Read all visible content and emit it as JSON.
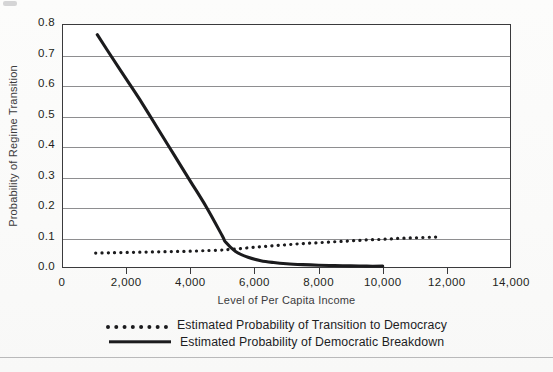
{
  "chart_data": {
    "type": "line",
    "title": "",
    "xlabel": "Level of Per Capita Income",
    "ylabel": "Probability of Regime Transition",
    "xlim": [
      0,
      14000
    ],
    "ylim": [
      0.0,
      0.8
    ],
    "grid": true,
    "legend_position": "bottom-center",
    "xticks": [
      0,
      2000,
      4000,
      6000,
      8000,
      10000,
      12000,
      14000
    ],
    "xticklabels": [
      "0",
      "2,000",
      "4,000",
      "6,000",
      "8,000",
      "10,000",
      "12,000",
      "14,000"
    ],
    "yticks": [
      0.0,
      0.1,
      0.2,
      0.3,
      0.4,
      0.5,
      0.6,
      0.7,
      0.8
    ],
    "yticklabels": [
      "0.0",
      "0.1",
      "0.2",
      "0.3",
      "0.4",
      "0.5",
      "0.6",
      "0.7",
      "0.8"
    ],
    "series": [
      {
        "name": "Estimated Probability of Transition to Democracy",
        "style": "dotted",
        "color": "#1b1b1d",
        "x": [
          1050,
          1500,
          2000,
          2500,
          3000,
          3500,
          4000,
          4500,
          5000,
          5100,
          5500,
          6000,
          6500,
          7000,
          7500,
          8000,
          8500,
          9000,
          9500,
          10000,
          10500,
          11000,
          11500,
          11800
        ],
        "y": [
          0.049,
          0.05,
          0.051,
          0.052,
          0.053,
          0.054,
          0.055,
          0.057,
          0.059,
          0.06,
          0.063,
          0.068,
          0.072,
          0.076,
          0.08,
          0.083,
          0.086,
          0.089,
          0.092,
          0.094,
          0.097,
          0.099,
          0.101,
          0.102
        ]
      },
      {
        "name": "Estimated Probability of Democratic Breakdown",
        "style": "solid",
        "color": "#1b1b1d",
        "x": [
          1100,
          1500,
          2000,
          2500,
          3000,
          3500,
          4000,
          4500,
          5000,
          5100,
          5400,
          5800,
          6200,
          6600,
          7000,
          7500,
          8000,
          8500,
          9000,
          9500,
          10000
        ],
        "y": [
          0.765,
          0.7,
          0.62,
          0.54,
          0.455,
          0.37,
          0.285,
          0.2,
          0.105,
          0.085,
          0.055,
          0.035,
          0.024,
          0.018,
          0.014,
          0.011,
          0.009,
          0.008,
          0.007,
          0.006,
          0.006
        ]
      }
    ],
    "annotations": []
  },
  "legend": {
    "entries": [
      {
        "label": "Estimated Probability of Transition to Democracy",
        "key": "dotted-line-key"
      },
      {
        "label": "Estimated Probability of Democratic Breakdown",
        "key": "solid-line-key"
      }
    ]
  }
}
